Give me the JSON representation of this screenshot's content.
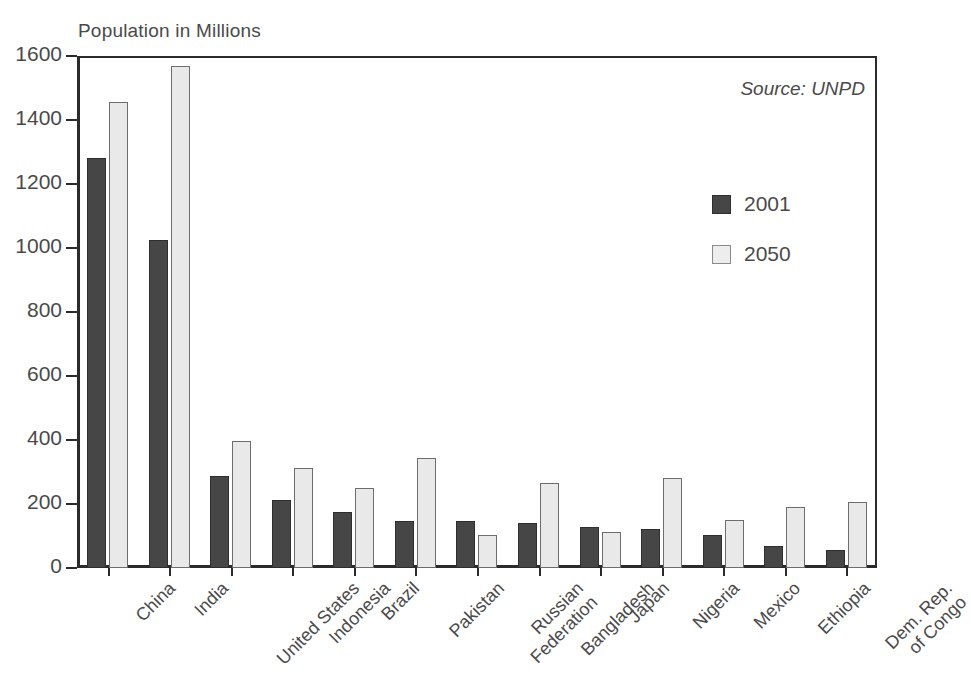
{
  "chart_data": {
    "type": "bar",
    "title": "",
    "ylabel": "Population in Millions",
    "xlabel": "",
    "ylim": [
      0,
      1600
    ],
    "yticks": [
      0,
      200,
      400,
      600,
      800,
      1000,
      1200,
      1400,
      1600
    ],
    "grid": false,
    "legend_position": "right",
    "annotation": "Source: UNPD",
    "categories": [
      "China",
      "India",
      "United States",
      "Indonesia",
      "Brazil",
      "Pakistan",
      "Russian\nFederation",
      "Bangladesh",
      "Japan",
      "Nigeria",
      "Mexico",
      "Ethiopia",
      "Dem. Rep.\nof Congo"
    ],
    "series": [
      {
        "name": "2001",
        "color": "#464646",
        "values": [
          1280,
          1025,
          288,
          214,
          174,
          146,
          146,
          142,
          128,
          122,
          102,
          68,
          55
        ]
      },
      {
        "name": "2050",
        "color": "#e9e9e9",
        "values": [
          1455,
          1570,
          397,
          313,
          249,
          345,
          104,
          265,
          112,
          280,
          151,
          192,
          207
        ]
      }
    ]
  },
  "legend": {
    "items": [
      {
        "label": "2001"
      },
      {
        "label": "2050"
      }
    ]
  }
}
